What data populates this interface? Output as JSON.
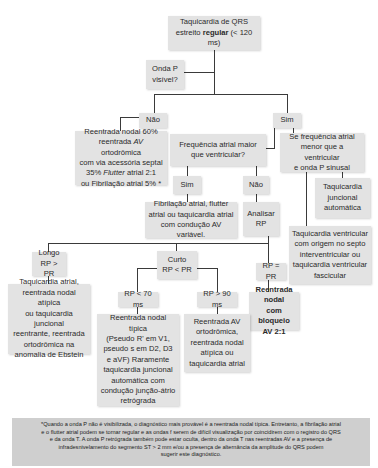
{
  "title": {
    "line1": "Taquicardia de QRS",
    "line2_pre": "estreito ",
    "line2_bold": "regular",
    "line2_post": " (< 120 ms)"
  },
  "question_p_visible": {
    "line1": "Onda P",
    "line2": "visível?"
  },
  "branch_no": "Não",
  "branch_yes": "Sim",
  "no_result": {
    "line1": "Reentrada nodal 60%",
    "line2_pre": "reentrada ",
    "line2_italic": "AV",
    "line2_post": " ortodrômica",
    "line3": "com via acessória septal",
    "line4_pre": "35% ",
    "line4_italic": "Flutter",
    "line4_post": " atrial 2:1",
    "line5": "ou Fibrilação atrial 5% *"
  },
  "question_freq": {
    "line1": "Frequência atrial maior",
    "line2": "que ventricular?"
  },
  "freq_yes": "Sim",
  "freq_no": "Não",
  "freq_yes_result": {
    "line1": "Fibrilação atrial, flutter",
    "line2": "atrial ou taquicardia atrial",
    "line3": "com condução AV variável."
  },
  "analyze_rp": {
    "line1": "Analisar",
    "line2": "RP"
  },
  "sinus_condition": {
    "line1": "Se frequência atrial",
    "line2": "menor que a ventricular",
    "line3": "e onda P sinusal"
  },
  "junctional_auto": {
    "line1": "Taquicardia",
    "line2": "juncional",
    "line3": "automática"
  },
  "ventricular_tachy": {
    "line1": "Taquicardia ventricular",
    "line2": "com origem no septo",
    "line3": "interventricular ou",
    "line4": "taquicardia ventricular",
    "line5": "fascicular"
  },
  "rp_long": {
    "line1": "Longo",
    "line2": "RP > PR"
  },
  "rp_short": {
    "line1": "Curto",
    "line2": "RP < PR"
  },
  "rp_equal": "RP = PR",
  "rp_long_result": {
    "line1": "Taquicardia atrial,",
    "line2": "reentrada nodal atípica",
    "line3": "ou taquicardia juncional",
    "line4": "reentrante, reentrada",
    "line5": "ortodrômica na",
    "line6": "anomalia de Ebstein"
  },
  "rp_lt70": "RP < 70 ms",
  "rp_gt90": "RP > 90 ms",
  "rp_lt70_result": {
    "line1": "Reentrada nodal típica",
    "line2": "(Pseudo R' em V1,",
    "line3": "pseudo s em D2, D3",
    "line4": "e aVF) Raramente",
    "line5": "taquicardia juncional",
    "line6": "automática com",
    "line7": "condução junção-átrio",
    "line8": "retrógrada"
  },
  "rp_gt90_result": {
    "line1": "Reentrada AV",
    "line2": "ortodrômica,",
    "line3": "reentrada nodal",
    "line4": "atípica ou",
    "line5": "taquicardia atrial"
  },
  "rp_equal_result": {
    "line1": "Reentrada nodal",
    "line2": "com bloqueio",
    "line3": "AV 2:1"
  },
  "footnote": {
    "line1": "*Quando a onda P não é visibilizada, o diagnóstico mais provável é a reentrada nodal típica. Entretanto, a fibrilação atrial",
    "line2": "e o flutter atrial podem se tornar regular e as ondas f serem de difícil visualização por coincidirem com o registro do QRS",
    "line3": "e da onda T. A onda P retrógrada também pode estar oculta, dentro da onda T nas reentradas AV e a presença de",
    "line4": "infradesnivelamento do segmento ST > 2 mm e/ou a presença de alternância da amplitude do QRS podem",
    "line5": "sugerir este diagnóstico."
  }
}
